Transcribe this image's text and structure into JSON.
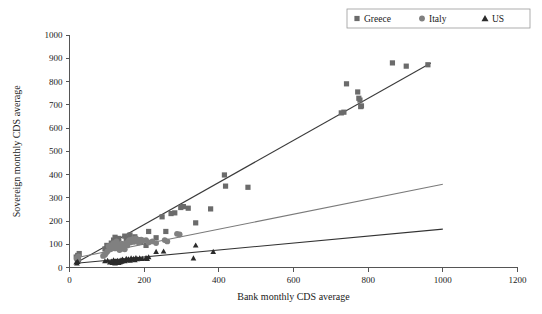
{
  "chart_data": {
    "type": "scatter",
    "title": "",
    "xlabel": "Bank monthly CDS average",
    "ylabel": "Sovereign monthly CDS average",
    "xlim": [
      0,
      1200
    ],
    "ylim": [
      0,
      1000
    ],
    "xticks": [
      0,
      200,
      400,
      600,
      800,
      1000,
      1200
    ],
    "yticks": [
      0,
      100,
      200,
      300,
      400,
      500,
      600,
      700,
      800,
      900,
      1000
    ],
    "grid": false,
    "legend_position": "top-right",
    "series": [
      {
        "name": "Greece",
        "marker": "square",
        "color": "#6b6b6b",
        "points": [
          [
            18,
            45
          ],
          [
            20,
            38
          ],
          [
            22,
            52
          ],
          [
            24,
            30
          ],
          [
            26,
            60
          ],
          [
            95,
            80
          ],
          [
            100,
            95
          ],
          [
            108,
            88
          ],
          [
            112,
            105
          ],
          [
            118,
            118
          ],
          [
            122,
            130
          ],
          [
            128,
            112
          ],
          [
            132,
            125
          ],
          [
            138,
            100
          ],
          [
            142,
            92
          ],
          [
            148,
            135
          ],
          [
            152,
            122
          ],
          [
            158,
            128
          ],
          [
            162,
            140
          ],
          [
            168,
            118
          ],
          [
            175,
            132
          ],
          [
            182,
            120
          ],
          [
            190,
            110
          ],
          [
            205,
            95
          ],
          [
            212,
            155
          ],
          [
            232,
            128
          ],
          [
            248,
            218
          ],
          [
            258,
            155
          ],
          [
            272,
            232
          ],
          [
            282,
            235
          ],
          [
            298,
            258
          ],
          [
            305,
            262
          ],
          [
            318,
            255
          ],
          [
            338,
            192
          ],
          [
            378,
            252
          ],
          [
            415,
            398
          ],
          [
            418,
            350
          ],
          [
            478,
            345
          ],
          [
            728,
            665
          ],
          [
            735,
            668
          ],
          [
            742,
            790
          ],
          [
            772,
            755
          ],
          [
            775,
            728
          ],
          [
            778,
            720
          ],
          [
            780,
            692
          ],
          [
            782,
            695
          ],
          [
            865,
            880
          ],
          [
            902,
            866
          ],
          [
            960,
            872
          ]
        ]
      },
      {
        "name": "Italy",
        "marker": "circle",
        "color": "#808080",
        "points": [
          [
            20,
            40
          ],
          [
            22,
            35
          ],
          [
            24,
            48
          ],
          [
            90,
            50
          ],
          [
            95,
            55
          ],
          [
            98,
            62
          ],
          [
            102,
            70
          ],
          [
            105,
            92
          ],
          [
            108,
            85
          ],
          [
            110,
            78
          ],
          [
            112,
            96
          ],
          [
            115,
            88
          ],
          [
            118,
            105
          ],
          [
            120,
            98
          ],
          [
            122,
            82
          ],
          [
            124,
            90
          ],
          [
            126,
            112
          ],
          [
            128,
            100
          ],
          [
            130,
            84
          ],
          [
            132,
            95
          ],
          [
            134,
            75
          ],
          [
            136,
            88
          ],
          [
            138,
            80
          ],
          [
            140,
            102
          ],
          [
            142,
            92
          ],
          [
            145,
            86
          ],
          [
            148,
            78
          ],
          [
            152,
            105
          ],
          [
            155,
            95
          ],
          [
            158,
            112
          ],
          [
            160,
            118
          ],
          [
            163,
            108
          ],
          [
            166,
            120
          ],
          [
            168,
            114
          ],
          [
            170,
            122
          ],
          [
            172,
            110
          ],
          [
            175,
            118
          ],
          [
            178,
            125
          ],
          [
            180,
            115
          ],
          [
            182,
            120
          ],
          [
            185,
            108
          ],
          [
            188,
            112
          ],
          [
            192,
            120
          ],
          [
            196,
            116
          ],
          [
            205,
            118
          ],
          [
            212,
            108
          ],
          [
            222,
            112
          ],
          [
            232,
            105
          ],
          [
            255,
            118
          ],
          [
            262,
            112
          ],
          [
            288,
            145
          ],
          [
            295,
            142
          ]
        ]
      },
      {
        "name": "US",
        "marker": "triangle",
        "color": "#2b2b2b",
        "points": [
          [
            18,
            22
          ],
          [
            20,
            18
          ],
          [
            22,
            25
          ],
          [
            95,
            28
          ],
          [
            102,
            30
          ],
          [
            108,
            22
          ],
          [
            112,
            26
          ],
          [
            115,
            20
          ],
          [
            118,
            32
          ],
          [
            120,
            24
          ],
          [
            122,
            18
          ],
          [
            124,
            28
          ],
          [
            126,
            22
          ],
          [
            128,
            30
          ],
          [
            130,
            25
          ],
          [
            132,
            20
          ],
          [
            134,
            28
          ],
          [
            136,
            24
          ],
          [
            138,
            32
          ],
          [
            140,
            26
          ],
          [
            142,
            35
          ],
          [
            145,
            30
          ],
          [
            148,
            28
          ],
          [
            152,
            38
          ],
          [
            155,
            32
          ],
          [
            158,
            36
          ],
          [
            162,
            30
          ],
          [
            165,
            40
          ],
          [
            168,
            34
          ],
          [
            172,
            38
          ],
          [
            175,
            32
          ],
          [
            178,
            42
          ],
          [
            182,
            36
          ],
          [
            188,
            40
          ],
          [
            195,
            38
          ],
          [
            205,
            42
          ],
          [
            208,
            38
          ],
          [
            212,
            45
          ],
          [
            232,
            68
          ],
          [
            252,
            70
          ],
          [
            332,
            40
          ],
          [
            338,
            95
          ],
          [
            385,
            68
          ]
        ]
      }
    ],
    "trendlines": [
      {
        "name": "Greece",
        "color": "#3a3a3a",
        "x0": 18,
        "y0": 20,
        "x1": 968,
        "y1": 880
      },
      {
        "name": "Italy",
        "color": "#7a7a7a",
        "x0": 18,
        "y0": 42,
        "x1": 1000,
        "y1": 358
      },
      {
        "name": "US",
        "color": "#333333",
        "x0": 18,
        "y0": 18,
        "x1": 1000,
        "y1": 165
      }
    ]
  },
  "legend": {
    "items": [
      {
        "label": "Greece",
        "marker": "square",
        "color": "#6b6b6b"
      },
      {
        "label": "Italy",
        "marker": "circle",
        "color": "#808080"
      },
      {
        "label": "US",
        "marker": "triangle",
        "color": "#2b2b2b"
      }
    ]
  },
  "axes": {
    "x_title": "Bank monthly CDS average",
    "y_title": "Sovereign monthly CDS average",
    "x_tick_labels": [
      "0",
      "200",
      "400",
      "600",
      "800",
      "1000",
      "1200"
    ],
    "y_tick_labels": [
      "0",
      "100",
      "200",
      "300",
      "400",
      "500",
      "600",
      "700",
      "800",
      "900",
      "1000"
    ]
  }
}
